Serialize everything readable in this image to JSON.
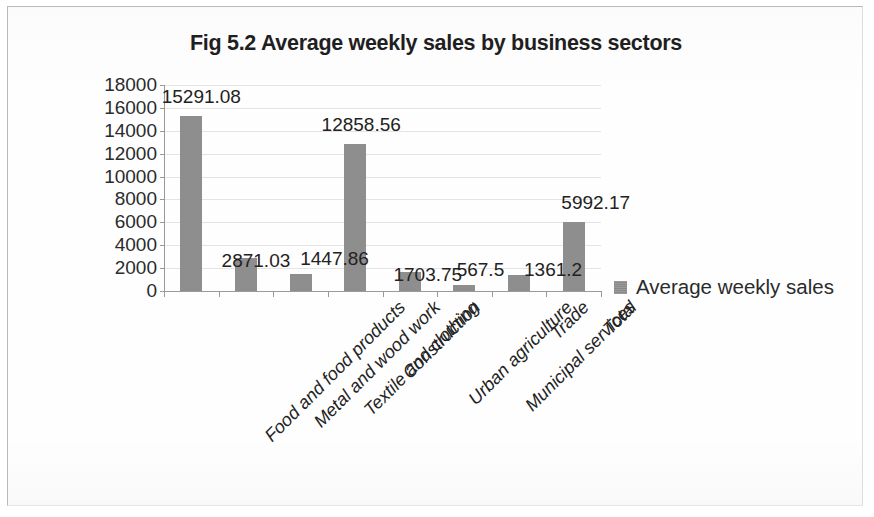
{
  "chart_data": {
    "type": "bar",
    "title": "Fig 5.2 Average weekly sales by business sectors",
    "xlabel": "",
    "ylabel": "",
    "ylim": [
      0,
      18000
    ],
    "y_ticks": [
      "0",
      "2000",
      "4000",
      "6000",
      "8000",
      "10000",
      "12000",
      "14000",
      "16000",
      "18000"
    ],
    "grid": true,
    "legend_position": "right",
    "categories": [
      "Food and food products",
      "Metal and wood work",
      "Textile and clothing",
      "Construction",
      "Urban agriculture",
      "Municipal services",
      "Trade",
      "Total"
    ],
    "series": [
      {
        "name": "Average weekly sales",
        "color": "#8e8e8e",
        "values": [
          15291.08,
          2871.03,
          1447.86,
          12858.56,
          1703.75,
          567.5,
          1361.2,
          5992.17
        ]
      }
    ],
    "data_labels": [
      "15291.08",
      "2871.03",
      "1447.86",
      "12858.56",
      "1703.75",
      "567.5",
      "1361.2",
      "5992.17"
    ]
  },
  "legend": {
    "entries": [
      {
        "label": "Average weekly sales",
        "color": "#8e8e8e"
      }
    ]
  }
}
